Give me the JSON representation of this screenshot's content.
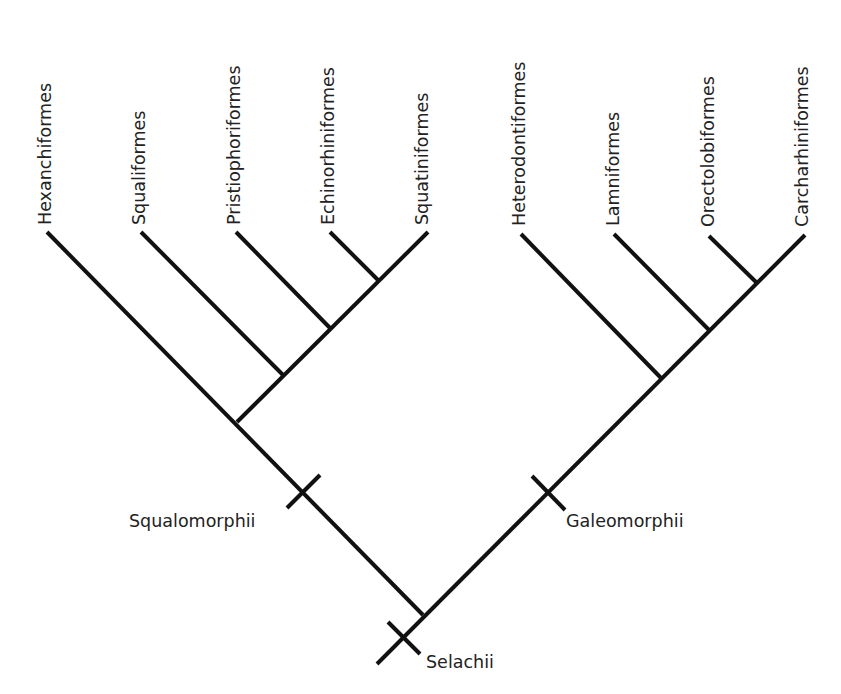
{
  "diagram": {
    "type": "cladogram",
    "root_clade": "Selachii",
    "colors": {
      "line": "#111111",
      "text": "#222222",
      "background": "#ffffff"
    },
    "taxa": [
      {
        "name": "Hexanchiformes",
        "group": "Squalomorphii",
        "tip": [
          47,
          232
        ],
        "label_x": 44
      },
      {
        "name": "Squaliformes",
        "group": "Squalomorphii",
        "tip": [
          141,
          232
        ],
        "label_x": 138
      },
      {
        "name": "Pristiophoriformes",
        "group": "Squalomorphii",
        "tip": [
          236,
          232
        ],
        "label_x": 233
      },
      {
        "name": "Echinorhiniformes",
        "group": "Squalomorphii",
        "tip": [
          330,
          232
        ],
        "label_x": 327
      },
      {
        "name": "Squatiniformes",
        "group": "Squalomorphii",
        "tip": [
          428,
          232
        ],
        "label_x": 421
      },
      {
        "name": "Heterodontiformes",
        "group": "Galeomorphii",
        "tip": [
          521,
          234
        ],
        "label_x": 518
      },
      {
        "name": "Lamniformes",
        "group": "Galeomorphii",
        "tip": [
          614,
          234
        ],
        "label_x": 612
      },
      {
        "name": "Orectolobiformes",
        "group": "Galeomorphii",
        "tip": [
          709,
          236
        ],
        "label_x": 707
      },
      {
        "name": "Carcharhiniformes",
        "group": "Galeomorphii",
        "tip": [
          805,
          235
        ],
        "label_x": 801
      }
    ],
    "clades": [
      {
        "name": "Squalomorphii",
        "tick_center": [
          303,
          491
        ],
        "label_pos": [
          130,
          530
        ],
        "anchor": "start"
      },
      {
        "name": "Galeomorphii",
        "tick_center": [
          548,
          492
        ],
        "label_pos": [
          566,
          530
        ],
        "anchor": "start"
      },
      {
        "name": "Selachii",
        "tick_center": [
          404,
          637
        ],
        "label_pos": [
          426,
          671
        ],
        "anchor": "start"
      }
    ],
    "branches": [
      {
        "from": [
          47,
          232
        ],
        "to": [
          423,
          615
        ]
      },
      {
        "from": [
          141,
          232
        ],
        "to": [
          283,
          375
        ]
      },
      {
        "from": [
          236,
          232
        ],
        "to": [
          330,
          328
        ]
      },
      {
        "from": [
          330,
          232
        ],
        "to": [
          378,
          280
        ]
      },
      {
        "from": [
          428,
          232
        ],
        "to": [
          237,
          422
        ]
      },
      {
        "from": [
          521,
          234
        ],
        "to": [
          661,
          378
        ]
      },
      {
        "from": [
          614,
          234
        ],
        "to": [
          709,
          330
        ]
      },
      {
        "from": [
          709,
          236
        ],
        "to": [
          756,
          282
        ]
      },
      {
        "from": [
          805,
          235
        ],
        "to": [
          423,
          615
        ]
      },
      {
        "from": [
          423,
          615
        ],
        "to": [
          377,
          664
        ]
      }
    ]
  },
  "labels": {
    "taxon_0": "Hexanchiformes",
    "taxon_1": "Squaliformes",
    "taxon_2": "Pristiophoriformes",
    "taxon_3": "Echinorhiniformes",
    "taxon_4": "Squatiniformes",
    "taxon_5": "Heterodontiformes",
    "taxon_6": "Lamniformes",
    "taxon_7": "Orectolobiformes",
    "taxon_8": "Carcharhiniformes",
    "clade_squalomorphii": "Squalomorphii",
    "clade_galeomorphii": "Galeomorphii",
    "clade_selachii": "Selachii"
  }
}
